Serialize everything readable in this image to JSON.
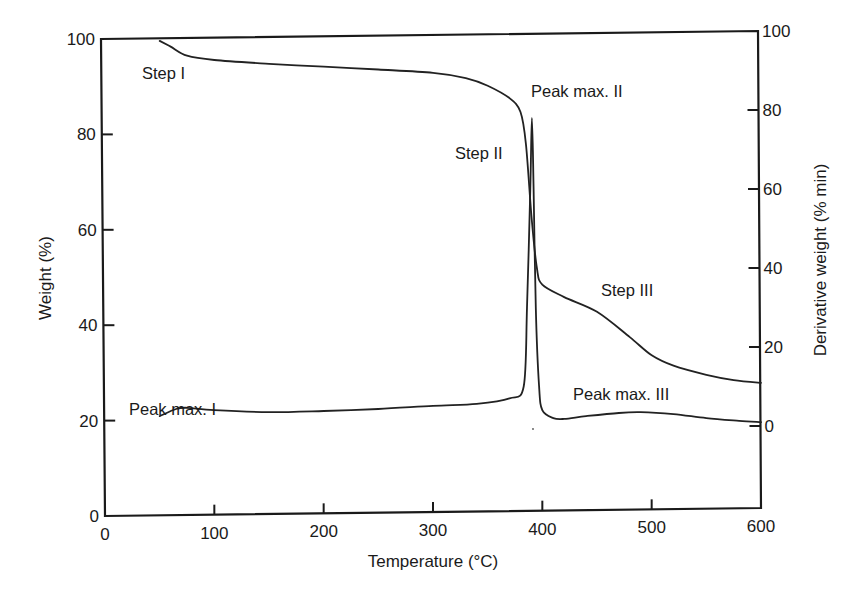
{
  "chart_data": {
    "type": "line",
    "title": "",
    "xlabel": "Temperature (°C)",
    "ylabel": "Weight (%)",
    "ylabel_right": "Derivative weight (% min)",
    "xlim": [
      0,
      600
    ],
    "ylim": [
      0,
      100
    ],
    "ylim_right": [
      -21,
      100
    ],
    "grid": false,
    "legend": null,
    "x_ticks": [
      0,
      100,
      200,
      300,
      400,
      500,
      600
    ],
    "x_tick_labels": [
      "0",
      "100",
      "200",
      "300",
      "400",
      "500",
      "600"
    ],
    "y_ticks": [
      0,
      20,
      40,
      60,
      80,
      100
    ],
    "y_tick_labels": [
      "0",
      "20",
      "40",
      "60",
      "80",
      "100"
    ],
    "y_right_ticks": [
      0,
      20,
      40,
      60,
      80,
      100
    ],
    "y_right_tick_labels": [
      "0",
      "20",
      "40",
      "60",
      "80",
      "100"
    ],
    "series": [
      {
        "name": "Weight (TG)",
        "axis": "left",
        "x": [
          50,
          60,
          75,
          100,
          150,
          200,
          250,
          300,
          330,
          350,
          370,
          380,
          385,
          390,
          395,
          400,
          420,
          450,
          480,
          500,
          520,
          550,
          575,
          600
        ],
        "values": [
          99.6,
          98.4,
          96.5,
          95.6,
          94.8,
          94.2,
          93.6,
          92.9,
          91.8,
          90.2,
          87.6,
          84.7,
          78.0,
          63.0,
          52.0,
          48.5,
          45.9,
          42.8,
          37.5,
          33.7,
          31.5,
          29.6,
          28.5,
          27.9
        ]
      },
      {
        "name": "Derivative weight (DTG)",
        "axis": "right",
        "x": [
          50,
          65,
          75,
          100,
          150,
          200,
          250,
          300,
          340,
          370,
          383,
          386,
          389,
          390.5,
          392,
          394,
          397,
          400,
          410,
          420,
          440,
          470,
          490,
          520,
          550,
          580,
          600
        ],
        "values": [
          2.5,
          4.3,
          4.6,
          4.0,
          3.5,
          3.8,
          4.3,
          5.1,
          5.6,
          7.0,
          10.0,
          30.0,
          60.0,
          78.0,
          60.0,
          30.0,
          10.0,
          4.0,
          2.0,
          1.8,
          2.5,
          3.3,
          3.5,
          3.0,
          2.0,
          1.3,
          1.0
        ]
      }
    ],
    "annotations": [
      {
        "text": "Step I",
        "x": 34,
        "y": 92,
        "axis": "left"
      },
      {
        "text": "Step II",
        "x": 320,
        "y": 75,
        "axis": "left"
      },
      {
        "text": "Step III",
        "x": 454,
        "y": 46,
        "axis": "left"
      },
      {
        "text": "Peak max. I",
        "x": 22,
        "y": 21,
        "axis": "left"
      },
      {
        "text": "Peak max. II",
        "x": 390,
        "y": 85,
        "axis": "right"
      },
      {
        "text": "Peak max. III",
        "x": 428,
        "y": 7,
        "axis": "right"
      }
    ]
  },
  "labels": {
    "x_axis_title": "Temperature (°C)",
    "y_axis_title": "Weight (%)",
    "y_right_axis_title": "Derivative weight (% min)",
    "step_1": "Step I",
    "step_2": "Step II",
    "step_3": "Step III",
    "peak_1": "Peak max. I",
    "peak_2": "Peak max. II",
    "peak_3": "Peak max. III"
  }
}
